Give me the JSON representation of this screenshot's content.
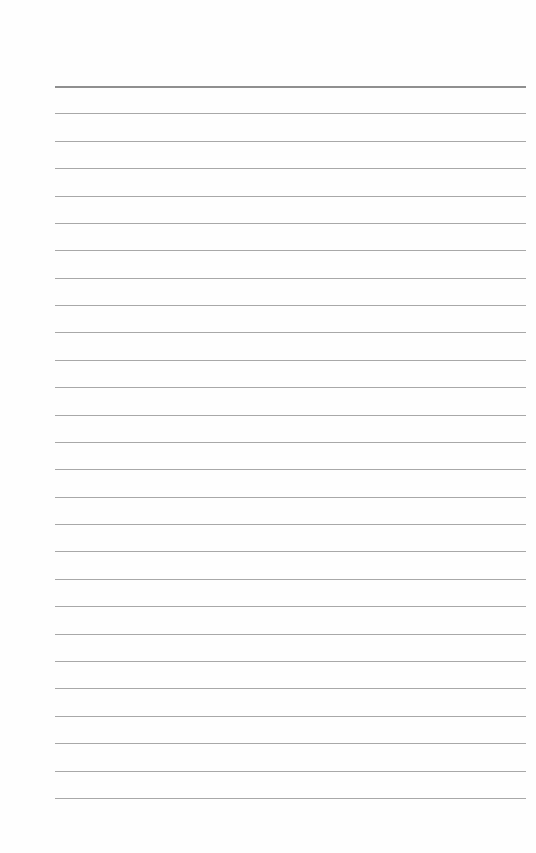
{
  "page": {
    "type": "lined-paper",
    "background": "#fefefe",
    "line_color": "#a8a8a8",
    "top_line_color": "#8f8f8f",
    "line_count": 27,
    "first_line_y": 86,
    "line_spacing": 27.38,
    "left": 55,
    "right": 526
  }
}
